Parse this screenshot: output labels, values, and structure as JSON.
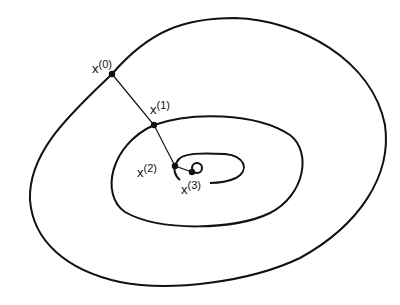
{
  "diagram": {
    "type": "contour-iteration",
    "contours": [
      "outer",
      "middle",
      "inner"
    ],
    "points": [
      {
        "id": "x0",
        "base": "x",
        "sup": "(0)",
        "cx": 112,
        "cy": 74
      },
      {
        "id": "x1",
        "base": "x",
        "sup": "(1)",
        "cx": 154,
        "cy": 125
      },
      {
        "id": "x2",
        "base": "x",
        "sup": "(2)",
        "cx": 175,
        "cy": 166
      },
      {
        "id": "x3",
        "base": "x",
        "sup": "(3)",
        "cx": 192,
        "cy": 172
      }
    ],
    "colors": {
      "stroke": "#111111",
      "background": "#ffffff"
    }
  }
}
